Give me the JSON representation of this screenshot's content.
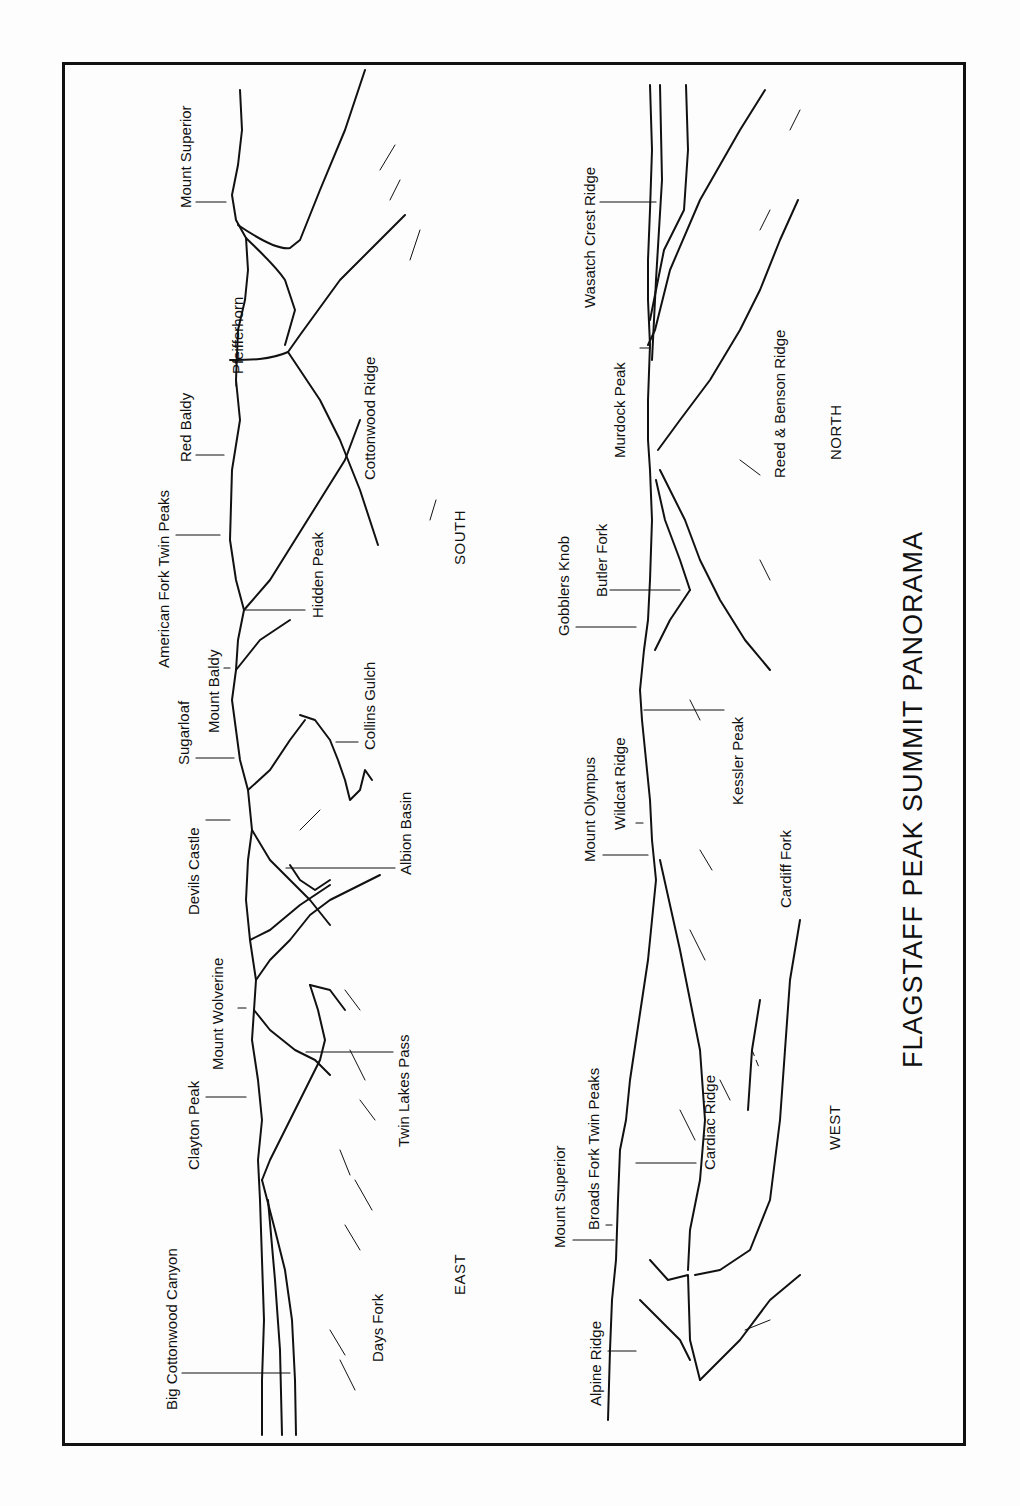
{
  "title": "FLAGSTAFF PEAK SUMMIT PANORAMA",
  "directions": {
    "south": "SOUTH",
    "east": "EAST",
    "north": "NORTH",
    "west": "WEST"
  },
  "top_panel": {
    "labels": [
      "Mount Superior",
      "Pfeifferhorn",
      "Red Baldy",
      "Cottonwood Ridge",
      "American Fork Twin Peaks",
      "Hidden Peak",
      "Mount Baldy",
      "Sugarloaf",
      "Collins Gulch",
      "Devils Castle",
      "Albion Basin",
      "Mount Wolverine",
      "Twin Lakes Pass",
      "Clayton Peak",
      "Big Cottonwood Canyon",
      "Days Fork"
    ]
  },
  "bottom_panel": {
    "labels": [
      "Wasatch Crest Ridge",
      "Murdock Peak",
      "Reed & Benson Ridge",
      "Gobblers Knob",
      "Butler Fork",
      "Kessler Peak",
      "Mount Olympus",
      "Wildcat Ridge",
      "Cardiff Fork",
      "Mount Superior",
      "Broads Fork Twin Peaks",
      "Cardiac Ridge",
      "Alpine Ridge"
    ]
  }
}
